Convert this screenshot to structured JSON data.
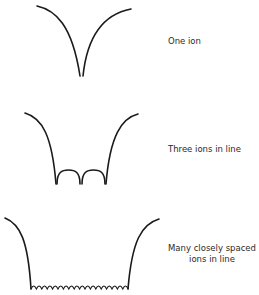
{
  "figure": {
    "panels": [
      {
        "id": "one-ion",
        "label": "One ion"
      },
      {
        "id": "three-ions",
        "label": "Three ions in line"
      },
      {
        "id": "many-ions",
        "label_line1": "Many closely spaced",
        "label_line2": "ions in line"
      }
    ],
    "colors": {
      "stroke": "#1a1a1a",
      "text": "#2a2a2a",
      "background": "#ffffff"
    }
  }
}
